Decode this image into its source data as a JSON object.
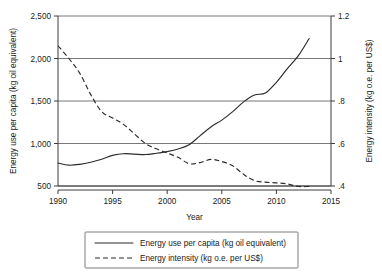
{
  "chart_data": {
    "type": "line",
    "title": "",
    "xlabel": "Year",
    "x": [
      1990,
      1991,
      1992,
      1993,
      1994,
      1995,
      1996,
      1997,
      1998,
      1999,
      2000,
      2001,
      2002,
      2003,
      2004,
      2005,
      2006,
      2007,
      2008,
      2009,
      2010,
      2011,
      2012,
      2013
    ],
    "xlim": [
      1990,
      2015
    ],
    "xticks": [
      1990,
      1995,
      2000,
      2005,
      2010,
      2015
    ],
    "xtick_labels": [
      "1990",
      "1995",
      "2000",
      "2005",
      "2010",
      "2015"
    ],
    "grid": true,
    "legend_position": "below-plot",
    "axes": [
      {
        "id": "left",
        "label": "Energy use per capita (kg oil equivalent)",
        "lim": [
          500,
          2500
        ],
        "ticks": [
          500,
          1000,
          1500,
          2000,
          2500
        ],
        "tick_labels": [
          "500",
          "1,000",
          "1,500",
          "2,000",
          "2,500"
        ]
      },
      {
        "id": "right",
        "label": "Energy intensity (kg o.e. per US$)",
        "lim": [
          0.4,
          1.2
        ],
        "ticks": [
          0.4,
          0.6,
          0.8,
          1.0,
          1.2
        ],
        "tick_labels": [
          ".4",
          ".6",
          ".8",
          "1",
          "1.2"
        ]
      }
    ],
    "series": [
      {
        "name": "Energy use per capita (kg oil equivalent)",
        "axis": "left",
        "style": "solid",
        "values": [
          770,
          745,
          755,
          780,
          815,
          860,
          880,
          875,
          870,
          885,
          905,
          935,
          985,
          1090,
          1195,
          1275,
          1375,
          1490,
          1570,
          1595,
          1720,
          1880,
          2030,
          2235
        ]
      },
      {
        "name": "Energy intensity (kg o.e. per US$)",
        "axis": "right",
        "style": "dashed",
        "values": [
          1.06,
          1.0,
          0.93,
          0.83,
          0.75,
          0.72,
          0.69,
          0.645,
          0.6,
          0.575,
          0.555,
          0.535,
          0.505,
          0.51,
          0.525,
          0.515,
          0.495,
          0.455,
          0.425,
          0.418,
          0.415,
          0.41,
          0.398,
          0.398
        ]
      }
    ]
  },
  "legend": {
    "items": [
      {
        "label": "Energy use per capita (kg oil equivalent)",
        "style": "solid"
      },
      {
        "label": "Energy intensity (kg o.e. per US$)",
        "style": "dashed"
      }
    ]
  }
}
